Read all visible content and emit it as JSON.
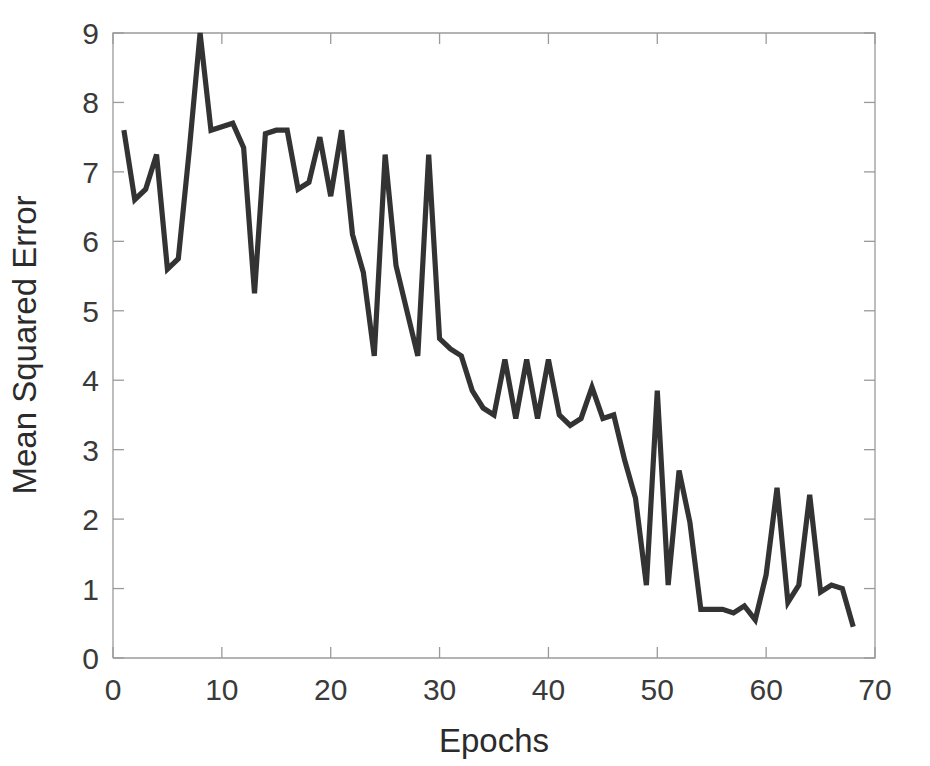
{
  "figure": {
    "title_faint": "",
    "background_color": "#ffffff",
    "line_color": "#333333",
    "axis_color": "#9a9a9a",
    "text_color": "#2b2b2b"
  },
  "chart_data": {
    "type": "line",
    "title": "",
    "xlabel": "Epochs",
    "ylabel": "Mean Squared Error",
    "xlim": [
      0,
      70
    ],
    "ylim": [
      0,
      9
    ],
    "xticks": [
      0,
      10,
      20,
      30,
      40,
      50,
      60,
      70
    ],
    "yticks": [
      0,
      1,
      2,
      3,
      4,
      5,
      6,
      7,
      8,
      9
    ],
    "grid": false,
    "legend": null,
    "series": [
      {
        "name": "Mean Squared Error",
        "color": "#333333",
        "x": [
          1,
          2,
          3,
          4,
          5,
          6,
          7,
          8,
          9,
          10,
          11,
          12,
          13,
          14,
          15,
          16,
          17,
          18,
          19,
          20,
          21,
          22,
          23,
          24,
          25,
          26,
          27,
          28,
          29,
          30,
          31,
          32,
          33,
          34,
          35,
          36,
          37,
          38,
          39,
          40,
          41,
          42,
          43,
          44,
          45,
          46,
          47,
          48,
          49,
          50,
          51,
          52,
          53,
          54,
          55,
          56,
          57,
          58,
          59,
          60,
          61,
          62,
          63,
          64,
          65,
          66,
          67,
          68
        ],
        "values": [
          7.6,
          6.6,
          6.75,
          7.25,
          5.6,
          5.75,
          7.3,
          9.0,
          7.6,
          7.65,
          7.7,
          7.35,
          5.25,
          7.55,
          7.6,
          7.6,
          6.75,
          6.85,
          7.5,
          6.65,
          7.6,
          6.1,
          5.55,
          4.35,
          7.25,
          5.65,
          5.0,
          4.35,
          7.25,
          4.6,
          4.45,
          4.35,
          3.85,
          3.6,
          3.5,
          4.3,
          3.45,
          4.3,
          3.45,
          4.3,
          3.5,
          3.35,
          3.45,
          3.9,
          3.45,
          3.5,
          2.85,
          2.3,
          1.05,
          3.85,
          1.05,
          2.7,
          1.95,
          0.7,
          0.7,
          0.7,
          0.65,
          0.75,
          0.55,
          1.2,
          2.45,
          0.8,
          1.05,
          2.35,
          0.95,
          1.05,
          1.0,
          0.45
        ]
      }
    ]
  }
}
